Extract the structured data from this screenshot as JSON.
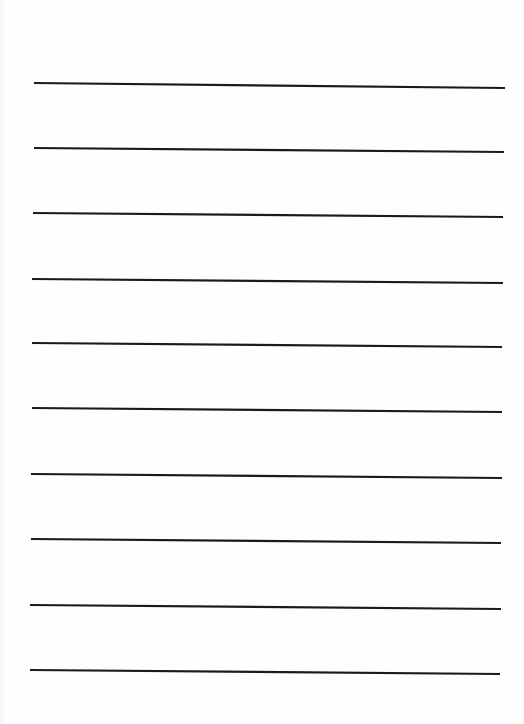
{
  "page": {
    "type": "blank ruled sheet",
    "background_color": "#fefefe",
    "line_color": "#1a1a1a",
    "line_thickness": 2.2,
    "line_count": 10
  },
  "ruled_lines": [
    {
      "x1": 34,
      "y1": 83,
      "x2": 505,
      "y2": 88
    },
    {
      "x1": 34,
      "y1": 148,
      "x2": 504,
      "y2": 152
    },
    {
      "x1": 33,
      "y1": 213,
      "x2": 503,
      "y2": 217
    },
    {
      "x1": 32,
      "y1": 279,
      "x2": 503,
      "y2": 283
    },
    {
      "x1": 32,
      "y1": 343,
      "x2": 502,
      "y2": 347
    },
    {
      "x1": 32,
      "y1": 408,
      "x2": 502,
      "y2": 412
    },
    {
      "x1": 31,
      "y1": 474,
      "x2": 502,
      "y2": 478
    },
    {
      "x1": 31,
      "y1": 539,
      "x2": 501,
      "y2": 543
    },
    {
      "x1": 30,
      "y1": 605,
      "x2": 501,
      "y2": 609
    },
    {
      "x1": 30,
      "y1": 670,
      "x2": 500,
      "y2": 674
    }
  ]
}
